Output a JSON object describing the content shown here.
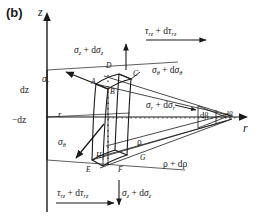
{
  "figure": {
    "panel_tag": "(b)",
    "caption_note": "Stress components on a differential element in cylindrical coordinates",
    "type": "engineering-stress-element-diagram",
    "background": "#ffffff",
    "line_color": "#1a1a1a"
  },
  "axes": {
    "vertical": {
      "label": "z",
      "name": "z-axis",
      "direction": "up"
    },
    "horizontal": {
      "label": "r",
      "name": "r-axis",
      "direction": "right"
    }
  },
  "dimensions": [
    {
      "id": "dz_upper",
      "label": "dz"
    },
    {
      "id": "dz_lower",
      "label": "−dz"
    },
    {
      "id": "radius_r",
      "label": "r"
    },
    {
      "id": "rho",
      "label": "ρ"
    },
    {
      "id": "rho_plus_drho",
      "label": "ρ + dρ"
    },
    {
      "id": "d_beta",
      "label": "dβ"
    },
    {
      "id": "d_beta_apex",
      "label": "dβ"
    }
  ],
  "stresses": [
    {
      "id": "sigma_z_top",
      "sym": "σ",
      "sub1": "z",
      "op": "+ d",
      "sym2": "σ",
      "sub2": "z",
      "arrow": "up"
    },
    {
      "id": "tau_rz_top",
      "sym": "τ",
      "sub1": "rz",
      "op": "+ d",
      "sym2": "τ",
      "sub2": "rz",
      "arrow": "right"
    },
    {
      "id": "sigma_theta_top",
      "sym": "σ",
      "sub1": "θ",
      "op": "+ d",
      "sym2": "σ",
      "sub2": "θ",
      "arrow": "none"
    },
    {
      "id": "sigma_r_left",
      "sym": "σ",
      "sub1": "r",
      "op": "",
      "sym2": "",
      "sub2": "",
      "arrow": "up-left"
    },
    {
      "id": "sigma_theta_left",
      "sym": "σ",
      "sub1": "θ",
      "op": "",
      "sym2": "",
      "sub2": "",
      "arrow": "down-left"
    },
    {
      "id": "sigma_r_right",
      "sym": "σ",
      "sub1": "r",
      "op": "+ d",
      "sym2": "σ",
      "sub2": "r",
      "arrow": "right"
    },
    {
      "id": "tau_rz_bottom",
      "sym": "τ",
      "sub1": "rz",
      "op": "+ d",
      "sym2": "τ",
      "sub2": "rz",
      "arrow": "right"
    },
    {
      "id": "sigma_z_bottom",
      "sym": "σ",
      "sub1": "z",
      "op": "+ d",
      "sym2": "σ",
      "sub2": "z",
      "arrow": "down"
    }
  ],
  "stress_text": {
    "sigma_z_top": "σz + dσz",
    "tau_rz_top": "τrz + dτrz",
    "sigma_theta_top": "σθ + dσθ",
    "sigma_r_left": "σr",
    "sigma_theta_left": "σθ",
    "sigma_r_right": "σr + dσr",
    "tau_rz_bottom": "τrz + dτrz",
    "sigma_z_bottom": "σz + dσz"
  },
  "vertices": [
    {
      "id": "A",
      "label": "A"
    },
    {
      "id": "B",
      "label": "B"
    },
    {
      "id": "C",
      "label": "C"
    },
    {
      "id": "D",
      "label": "D"
    },
    {
      "id": "E",
      "label": "E"
    },
    {
      "id": "F",
      "label": "F"
    },
    {
      "id": "G",
      "label": "G"
    },
    {
      "id": "H",
      "label": "H"
    }
  ],
  "glyphs": {
    "sigma": "σ",
    "tau": "τ",
    "theta": "θ",
    "rho": "ρ",
    "beta": "β",
    "plus_d": "+ d"
  }
}
